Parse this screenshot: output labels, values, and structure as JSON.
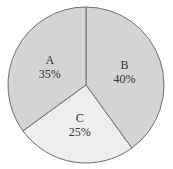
{
  "chart_data": {
    "type": "pie",
    "title": "",
    "start_angle_deg": 0,
    "direction": "clockwise",
    "slices": [
      {
        "label": "B",
        "value": 40,
        "display": "40%",
        "color": "#d4d4d4"
      },
      {
        "label": "C",
        "value": 25,
        "display": "25%",
        "color": "#eeeeee"
      },
      {
        "label": "A",
        "value": 35,
        "display": "35%",
        "color": "#d4d4d4"
      }
    ],
    "outline_color": "#6e6e6e",
    "legend": "none"
  }
}
